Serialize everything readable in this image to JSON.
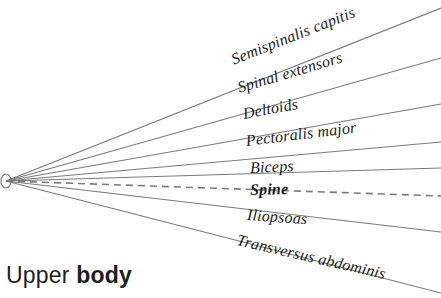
{
  "diagram": {
    "type": "radial-fan-label-diagram",
    "background_color": "#ffffff",
    "line_color": "#7a7a7a",
    "text_color": "#1a1a1a",
    "origin_marker": {
      "name": "origin-node",
      "shape": "ellipse",
      "cx": 6,
      "cy": 181,
      "rx": 5,
      "ry": 7
    },
    "rays": [
      {
        "id": "semispinalis-capitis",
        "label": "Semispinalis capitis",
        "style": "solid",
        "emphasis": false,
        "end_x": 441,
        "end_y": 8,
        "label_x": 232,
        "label_y": 60,
        "label_angle": -21.5,
        "font_size": 16
      },
      {
        "id": "spinal-extensors",
        "label": "Spinal extensors",
        "style": "solid",
        "emphasis": false,
        "end_x": 441,
        "end_y": 58,
        "label_x": 238,
        "label_y": 88,
        "label_angle": -16.5,
        "font_size": 16
      },
      {
        "id": "deltoids",
        "label": "Deltoids",
        "style": "solid",
        "emphasis": false,
        "end_x": 441,
        "end_y": 104,
        "label_x": 243,
        "label_y": 114,
        "label_angle": -10.5,
        "font_size": 16
      },
      {
        "id": "pectoralis-major",
        "label": "Pectoralis major",
        "style": "solid",
        "emphasis": false,
        "end_x": 441,
        "end_y": 142,
        "label_x": 246,
        "label_y": 141,
        "label_angle": -7,
        "font_size": 16
      },
      {
        "id": "biceps",
        "label": "Biceps",
        "style": "solid",
        "emphasis": false,
        "end_x": 441,
        "end_y": 168,
        "label_x": 250,
        "label_y": 168,
        "label_angle": -2.5,
        "font_size": 16
      },
      {
        "id": "spine",
        "label": "Spine",
        "style": "dashed",
        "emphasis": true,
        "end_x": 441,
        "end_y": 196,
        "label_x": 250,
        "label_y": 190,
        "label_angle": -1.5,
        "font_size": 16
      },
      {
        "id": "iliopsoas",
        "label": "Iliopsoas",
        "style": "solid",
        "emphasis": false,
        "end_x": 441,
        "end_y": 232,
        "label_x": 247,
        "label_y": 215,
        "label_angle": 4,
        "font_size": 16
      },
      {
        "id": "transversus-abdominis",
        "label": "Transversus abdominis",
        "style": "solid",
        "emphasis": false,
        "end_x": 441,
        "end_y": 293,
        "label_x": 237,
        "label_y": 240,
        "label_angle": 13,
        "font_size": 16
      }
    ]
  },
  "caption": {
    "prefix": "Upper ",
    "strong": "body"
  }
}
